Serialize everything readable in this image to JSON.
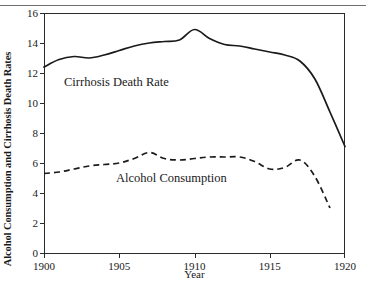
{
  "chart_data": {
    "type": "line",
    "title": "",
    "xlabel": "Year",
    "ylabel": "Alcohol Consumption and Cirrhosis Death Rates",
    "xlim": [
      1900,
      1920
    ],
    "ylim": [
      0,
      16
    ],
    "xticks": [
      1900,
      1905,
      1910,
      1915,
      1920
    ],
    "yticks": [
      0,
      2,
      4,
      6,
      8,
      10,
      12,
      14,
      16
    ],
    "grid": false,
    "legend_position": "inline-annotations",
    "series": [
      {
        "name": "Cirrhosis Death Rate",
        "style": "solid",
        "color": "#1a1a1a",
        "x": [
          1900,
          1901,
          1902,
          1903,
          1904,
          1905,
          1906,
          1907,
          1908,
          1909,
          1910,
          1911,
          1912,
          1913,
          1914,
          1915,
          1916,
          1917,
          1918,
          1919,
          1920
        ],
        "values": [
          12.4,
          12.9,
          13.1,
          13.0,
          13.2,
          13.5,
          13.8,
          14.0,
          14.1,
          14.2,
          14.9,
          14.3,
          13.9,
          13.8,
          13.6,
          13.4,
          13.2,
          12.8,
          11.6,
          9.4,
          7.1
        ]
      },
      {
        "name": "Alcohol Consumption",
        "style": "dashed",
        "color": "#1a1a1a",
        "x": [
          1900,
          1901,
          1902,
          1903,
          1904,
          1905,
          1906,
          1907,
          1908,
          1909,
          1910,
          1911,
          1912,
          1913,
          1914,
          1915,
          1916,
          1917,
          1918,
          1919
        ],
        "values": [
          5.3,
          5.4,
          5.6,
          5.8,
          5.9,
          6.0,
          6.3,
          6.7,
          6.3,
          6.2,
          6.3,
          6.4,
          6.4,
          6.4,
          6.1,
          5.6,
          5.7,
          6.2,
          5.1,
          3.0
        ]
      }
    ],
    "annotations": [
      {
        "text": "Cirrhosis Death Rate",
        "series": "Cirrhosis Death Rate"
      },
      {
        "text": "Alcohol Consumption",
        "series": "Alcohol Consumption"
      }
    ]
  }
}
